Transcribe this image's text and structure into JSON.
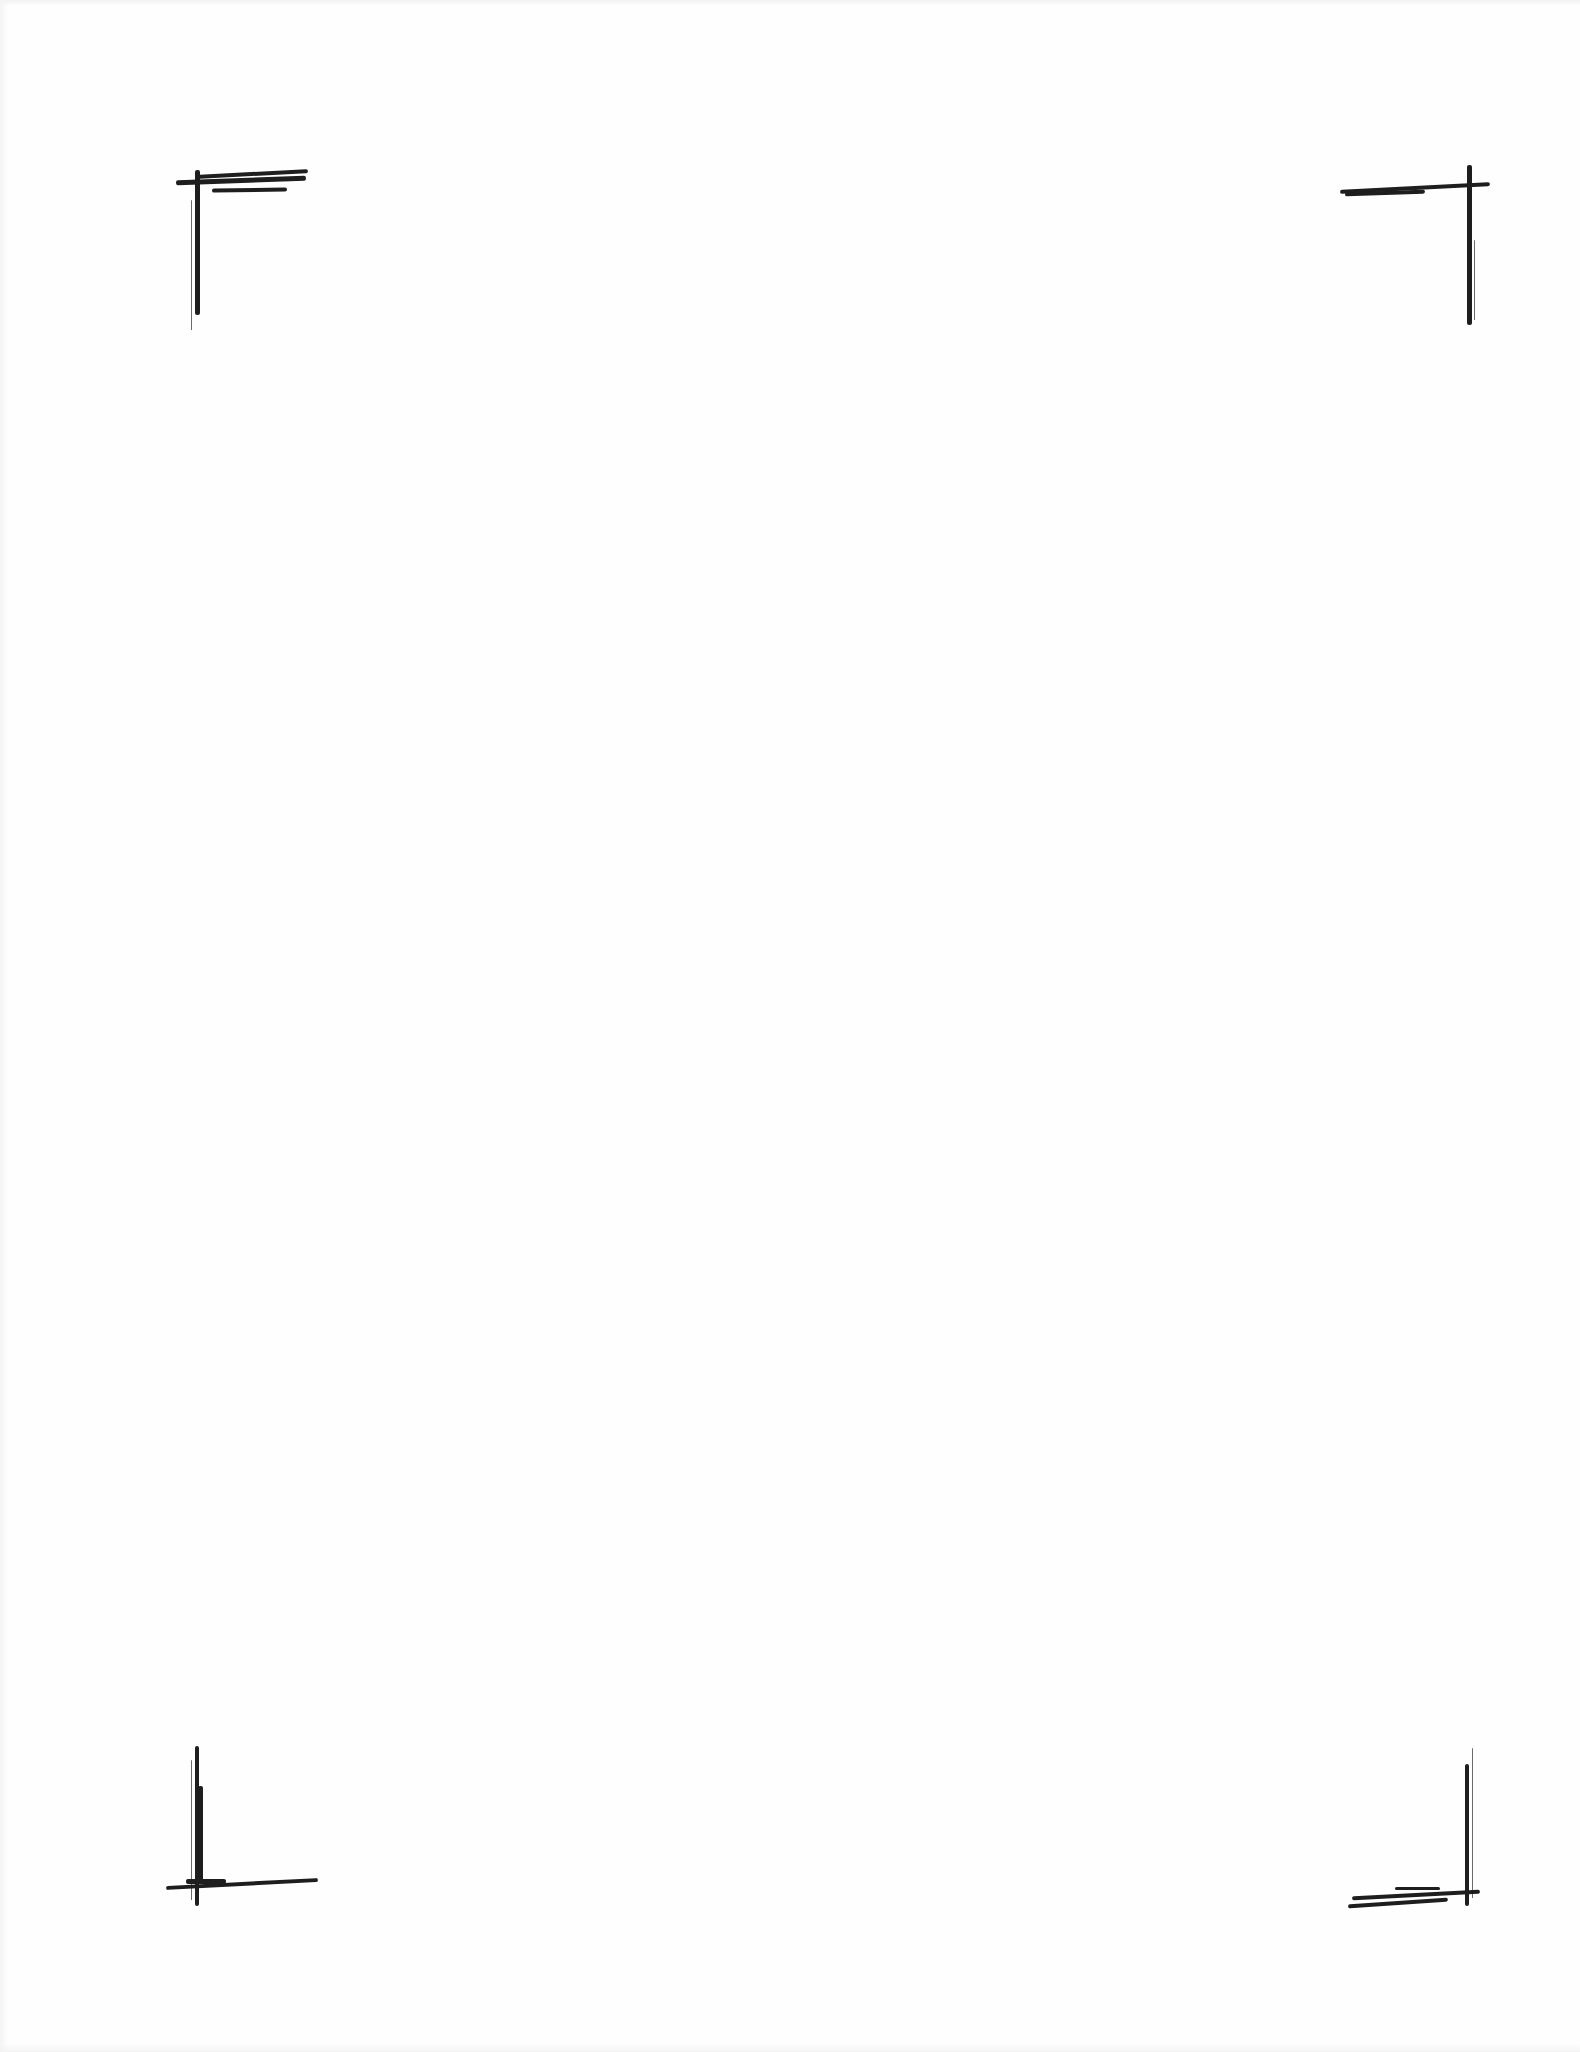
{
  "page": {
    "type": "blank scanned page",
    "background_color": "#ffffff",
    "ink_color": "#1e1e1e"
  },
  "corner_marks": [
    {
      "position": "top-left",
      "icon": "crop-mark-top-left-icon"
    },
    {
      "position": "top-right",
      "icon": "crop-mark-top-right-icon"
    },
    {
      "position": "bottom-left",
      "icon": "crop-mark-bottom-left-icon"
    },
    {
      "position": "bottom-right",
      "icon": "crop-mark-bottom-right-icon"
    }
  ]
}
